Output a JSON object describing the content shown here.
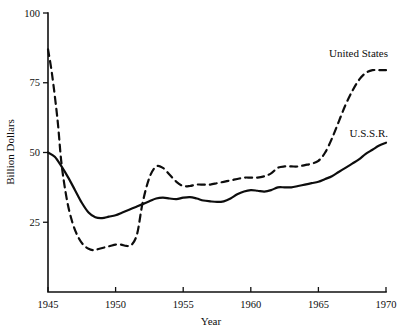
{
  "chart_data": {
    "type": "line",
    "title": "",
    "xlabel": "Year",
    "ylabel": "Billion Dollars",
    "xlim": [
      1945,
      1970
    ],
    "ylim": [
      0,
      100
    ],
    "xticks": [
      1945,
      1950,
      1955,
      1960,
      1965,
      1970
    ],
    "xtick_labels": [
      "1945",
      "1950",
      "1955",
      "1960",
      "1965",
      "1970"
    ],
    "yticks": [
      25,
      50,
      75,
      100
    ],
    "ytick_labels": [
      "25",
      "50",
      "75",
      "100"
    ],
    "grid": false,
    "legend_position": "inline-annotations",
    "series": [
      {
        "name": "United States",
        "style": "dashed",
        "label_text": "United States",
        "x": [
          1945,
          1945.3,
          1945.7,
          1946,
          1946.4,
          1946.8,
          1947.2,
          1947.6,
          1948,
          1948.4,
          1948.8,
          1949.2,
          1949.6,
          1950,
          1950.4,
          1950.8,
          1951.2,
          1951.6,
          1952,
          1952.5,
          1953,
          1953.5,
          1954,
          1954.5,
          1955,
          1955.5,
          1956,
          1956.5,
          1957,
          1957.5,
          1958,
          1958.5,
          1959,
          1959.5,
          1960,
          1960.5,
          1961,
          1961.5,
          1962,
          1962.5,
          1963,
          1963.5,
          1964,
          1964.5,
          1965,
          1965.5,
          1966,
          1966.5,
          1967,
          1967.5,
          1968,
          1968.5,
          1969,
          1969.5,
          1970
        ],
        "y": [
          87,
          78,
          62,
          46,
          33,
          25,
          20,
          17,
          15.5,
          15,
          15.5,
          16,
          16.5,
          17,
          17,
          16.5,
          17,
          21,
          32,
          41,
          45,
          44.5,
          42,
          39.5,
          38,
          38,
          38.5,
          38.5,
          38.5,
          39,
          39.5,
          40,
          40.5,
          41,
          41,
          41,
          41.5,
          42.5,
          44.5,
          45,
          45,
          45,
          45.5,
          46,
          47,
          50,
          55,
          61,
          67,
          72,
          76,
          78.5,
          79.5,
          79.5,
          79.5
        ]
      },
      {
        "name": "U.S.S.R.",
        "style": "solid",
        "label_text": "U.S.S.R.",
        "x": [
          1945,
          1945.5,
          1946,
          1946.5,
          1947,
          1947.5,
          1948,
          1948.5,
          1949,
          1949.5,
          1950,
          1950.5,
          1951,
          1951.5,
          1952,
          1952.5,
          1953,
          1953.5,
          1954,
          1954.5,
          1955,
          1955.5,
          1956,
          1956.5,
          1957,
          1957.5,
          1958,
          1958.5,
          1959,
          1959.5,
          1960,
          1960.5,
          1961,
          1961.5,
          1962,
          1962.5,
          1963,
          1963.5,
          1964,
          1964.5,
          1965,
          1965.5,
          1966,
          1966.5,
          1967,
          1967.5,
          1968,
          1968.5,
          1969,
          1969.5,
          1970
        ],
        "y": [
          50,
          48.5,
          45,
          41,
          36.5,
          32,
          28.5,
          26.8,
          26.5,
          27,
          27.5,
          28.5,
          29.5,
          30.5,
          31.5,
          32.5,
          33.5,
          33.8,
          33.5,
          33.3,
          33.8,
          34,
          33.5,
          32.8,
          32.5,
          32.3,
          32.5,
          33.5,
          35,
          36,
          36.5,
          36.3,
          36,
          36.5,
          37.5,
          37.5,
          37.5,
          38,
          38.5,
          39,
          39.5,
          40.5,
          41.5,
          43,
          44.5,
          46,
          47.5,
          49.5,
          51,
          52.5,
          53.5
        ]
      }
    ]
  },
  "annotations": {
    "us_label": "United States",
    "ussr_label": "U.S.S.R."
  }
}
